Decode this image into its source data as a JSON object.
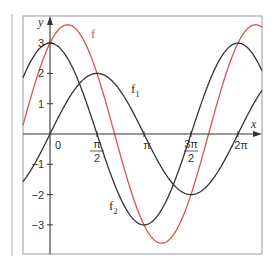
{
  "chart_data": {
    "type": "line",
    "title": "",
    "xlabel": "x",
    "ylabel": "y",
    "xlim": [
      -1.41,
      6.58
    ],
    "ylim": [
      -3.95,
      3.9
    ],
    "grid": false,
    "legend": "inline labels on curves",
    "x_ticks": [
      {
        "value": 0,
        "label": "0"
      },
      {
        "value": 1.5708,
        "label_num": "π",
        "label_den": "2"
      },
      {
        "value": 3.1416,
        "label": "π"
      },
      {
        "value": 4.7124,
        "label_num": "3π",
        "label_den": "2"
      },
      {
        "value": 6.2832,
        "label": "2π"
      }
    ],
    "y_ticks": [
      {
        "value": 3,
        "label": "3"
      },
      {
        "value": 2,
        "label": "2"
      },
      {
        "value": 1,
        "label": "1"
      },
      {
        "value": -1,
        "label": "−1"
      },
      {
        "value": -2,
        "label": "−2"
      },
      {
        "value": -3,
        "label": "−3"
      }
    ],
    "series": [
      {
        "name": "f",
        "label": "f",
        "subscript": "",
        "formula": "f(x) = f1(x) + f2(x) = 2·sin(x) + 3·cos(x)",
        "amplitude": 3.606,
        "sin_coef": 2,
        "cos_coef": 3,
        "color": "#d9534f",
        "label_pos": {
          "x": 91,
          "y": 38
        },
        "key_points": [
          {
            "x": 0,
            "y": 3
          },
          {
            "x": 0.588,
            "y": 3.606
          },
          {
            "x": 2.159,
            "y": 0
          },
          {
            "x": 3.73,
            "y": -3.606
          },
          {
            "x": 5.3,
            "y": 0
          },
          {
            "x": 6.283,
            "y": 3
          }
        ]
      },
      {
        "name": "f1",
        "label": "f",
        "subscript": "1",
        "formula": "f1(x) = 2·sin(x)",
        "amplitude": 2,
        "sin_coef": 2,
        "cos_coef": 0,
        "color": "#333333",
        "label_pos": {
          "x": 131,
          "y": 93
        },
        "key_points": [
          {
            "x": 0,
            "y": 0
          },
          {
            "x": 1.5708,
            "y": 2
          },
          {
            "x": 3.1416,
            "y": 0
          },
          {
            "x": 4.7124,
            "y": -2
          },
          {
            "x": 6.2832,
            "y": 0
          }
        ]
      },
      {
        "name": "f2",
        "label": "f",
        "subscript": "2",
        "formula": "f2(x) = 3·cos(x)",
        "amplitude": 3,
        "sin_coef": 0,
        "cos_coef": 3,
        "color": "#333333",
        "label_pos": {
          "x": 109,
          "y": 210
        },
        "key_points": [
          {
            "x": 0,
            "y": 3
          },
          {
            "x": 1.5708,
            "y": 0
          },
          {
            "x": 3.1416,
            "y": -3
          },
          {
            "x": 4.7124,
            "y": 0
          },
          {
            "x": 6.2832,
            "y": 3
          }
        ]
      }
    ]
  },
  "layout": {
    "frame": {
      "left": 23,
      "top": 16,
      "right": 262,
      "bottom": 254
    },
    "origin": {
      "x": 50,
      "y": 134
    },
    "px_per_unit_x": 29.92,
    "px_per_unit_y": 30.3,
    "margin_line_x": 12,
    "axis_color": "#333333",
    "frame_color": "#9a9a9a"
  }
}
